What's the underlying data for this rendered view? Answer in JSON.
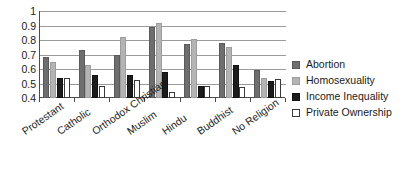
{
  "chart_data": {
    "type": "bar",
    "title": "",
    "subtitle": "",
    "xlabel": "",
    "ylabel": "",
    "ylim": [
      0.4,
      1
    ],
    "ytick_labels": [
      "1",
      "0.9",
      "0.8",
      "0.7",
      "0.6",
      "0.5",
      "0.4"
    ],
    "ytick_values": [
      1,
      0.9,
      0.8,
      0.7,
      0.6,
      0.5,
      0.4
    ],
    "grid": true,
    "legend_position": "right",
    "categories": [
      "Protestant",
      "Catholic",
      "Orthodox Christian",
      "Muslim",
      "Hindu",
      "Buddhist",
      "No Religion"
    ],
    "series": [
      {
        "name": "Abortion",
        "color": "#6e6e6e",
        "values": [
          0.68,
          0.73,
          0.7,
          0.89,
          0.775,
          0.78,
          0.59
        ]
      },
      {
        "name": "Homosexuality",
        "color": "#b4b4b4",
        "values": [
          0.645,
          0.63,
          0.82,
          0.92,
          0.805,
          0.755,
          0.54
        ]
      },
      {
        "name": "Income Inequality",
        "color": "#1c1c1c",
        "values": [
          0.535,
          0.56,
          0.56,
          0.58,
          0.485,
          0.625,
          0.52
        ]
      },
      {
        "name": "Private Ownership",
        "color": "#ffffff",
        "values": [
          0.54,
          0.485,
          0.525,
          0.44,
          0.48,
          0.475,
          0.53
        ]
      }
    ]
  },
  "legend": {
    "items": [
      {
        "label": "Abortion",
        "swatch": "legend-swatch-abortion"
      },
      {
        "label": "Homosexuality",
        "swatch": "legend-swatch-homosexuality"
      },
      {
        "label": "Income Inequality",
        "swatch": "legend-swatch-income-inequality"
      },
      {
        "label": "Private Ownership",
        "swatch": "legend-swatch-private-ownership"
      }
    ]
  }
}
